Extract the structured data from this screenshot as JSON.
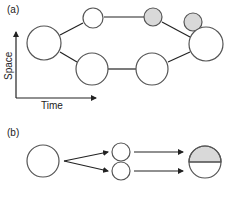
{
  "panel_a": {
    "label": "(a)",
    "y_axis_label": "Space",
    "x_axis_label": "Time"
  },
  "panel_b": {
    "label": "(b)"
  },
  "colors": {
    "stroke": "#333333",
    "fill_gray": "#d9d9d9",
    "fill_white": "#ffffff"
  }
}
